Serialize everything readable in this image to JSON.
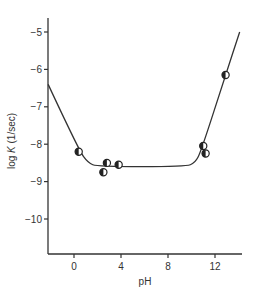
{
  "chart_data": {
    "type": "scatter",
    "title": "",
    "xlabel": "pH",
    "ylabel": "log K (1/sec)",
    "ylabel_parts": {
      "prefix": "log ",
      "italic": "K",
      "suffix": " (1/sec)"
    },
    "xlim": [
      -2.2,
      14.1
    ],
    "ylim": [
      -11.0,
      -4.6
    ],
    "xticks": [
      0,
      4,
      8,
      12
    ],
    "yticks": [
      -5,
      -6,
      -7,
      -8,
      -9,
      -10
    ],
    "grid": false,
    "legend": null,
    "series": [
      {
        "name": "measured",
        "type": "scatter",
        "marker": "half-filled circle",
        "points": [
          {
            "x": 0.4,
            "y": -8.2
          },
          {
            "x": 2.5,
            "y": -8.75
          },
          {
            "x": 2.8,
            "y": -8.5
          },
          {
            "x": 3.8,
            "y": -8.55
          },
          {
            "x": 11.0,
            "y": -8.05
          },
          {
            "x": 11.2,
            "y": -8.25
          },
          {
            "x": 12.9,
            "y": -6.15
          }
        ]
      },
      {
        "name": "fitted curve",
        "type": "line",
        "points": [
          {
            "x": -2.2,
            "y": -6.4
          },
          {
            "x": 0.4,
            "y": -8.15
          },
          {
            "x": 1.2,
            "y": -8.5
          },
          {
            "x": 2.0,
            "y": -8.6
          },
          {
            "x": 9.5,
            "y": -8.6
          },
          {
            "x": 10.3,
            "y": -8.5
          },
          {
            "x": 10.8,
            "y": -8.2
          },
          {
            "x": 12.9,
            "y": -6.15
          },
          {
            "x": 14.1,
            "y": -5.0
          }
        ]
      }
    ]
  }
}
